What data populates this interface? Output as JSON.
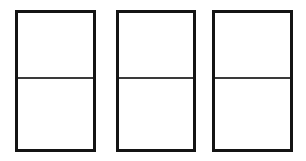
{
  "diagram": {
    "canvas": {
      "width": 306,
      "height": 161,
      "background_color": "#ffffff"
    },
    "style": {
      "border_color": "#141414",
      "border_width_px": 3,
      "divider_color": "#3a3a3a",
      "divider_width_px": 2,
      "fill_color": "#ffffff"
    },
    "panels": [
      {
        "id": "panel-1",
        "label": "Panel 1",
        "x": 15,
        "y": 10,
        "width": 81,
        "height": 142,
        "divider_offset_pct": 48,
        "sections": [
          {
            "id": "panel-1-upper",
            "label": "Upper Section"
          },
          {
            "id": "panel-1-lower",
            "label": "Lower Section"
          }
        ]
      },
      {
        "id": "panel-2",
        "label": "Panel 2",
        "x": 116,
        "y": 10,
        "width": 80,
        "height": 142,
        "divider_offset_pct": 48,
        "sections": [
          {
            "id": "panel-2-upper",
            "label": "Upper Section"
          },
          {
            "id": "panel-2-lower",
            "label": "Lower Section"
          }
        ]
      },
      {
        "id": "panel-3",
        "label": "Panel 3",
        "x": 212,
        "y": 10,
        "width": 81,
        "height": 142,
        "divider_offset_pct": 48,
        "sections": [
          {
            "id": "panel-3-upper",
            "label": "Upper Section"
          },
          {
            "id": "panel-3-lower",
            "label": "Lower Section"
          }
        ]
      }
    ]
  }
}
